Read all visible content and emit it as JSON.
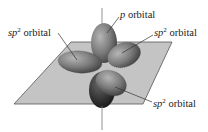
{
  "diagram": {
    "colors": {
      "plane_fill": "#c4c4c4",
      "plane_stroke": "#555555",
      "lobe_light": "#9a9a9a",
      "lobe_dark": "#3a3a3a",
      "axis": "#777777",
      "leader": "#333333"
    },
    "labels": [
      {
        "id": "p-top",
        "prefix": "p",
        "sup": "",
        "suffix": " orbital"
      },
      {
        "id": "sp2-left",
        "prefix": "sp",
        "sup": "2",
        "suffix": " orbital"
      },
      {
        "id": "sp2-right",
        "prefix": "sp",
        "sup": "2",
        "suffix": " orbital"
      },
      {
        "id": "sp2-bottom",
        "prefix": "sp",
        "sup": "2",
        "suffix": " orbital"
      }
    ]
  }
}
